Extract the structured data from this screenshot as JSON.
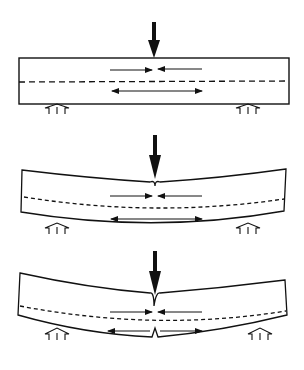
{
  "diagram": {
    "ink_color": "#111111",
    "background": "#ffffff",
    "panels": [
      {
        "id": "stage-1",
        "label": "Straight beam under central load",
        "state": "undeformed",
        "elements": [
          "load-arrow",
          "beam",
          "neutral-axis",
          "compression-arrows",
          "tension-arrows",
          "left-support",
          "right-support"
        ]
      },
      {
        "id": "stage-2",
        "label": "Bent beam with indentation at load point",
        "state": "bending",
        "elements": [
          "load-arrow",
          "beam",
          "neutral-axis",
          "compression-arrows",
          "tension-arrows",
          "left-support",
          "right-support",
          "notch-at-load"
        ]
      },
      {
        "id": "stage-3",
        "label": "Bent beam with crack at bottom tension face",
        "state": "cracking",
        "elements": [
          "load-arrow",
          "beam",
          "neutral-axis",
          "compression-arrows",
          "tension-arrows",
          "left-support",
          "right-support",
          "notch-at-load",
          "crack-at-bottom"
        ]
      }
    ]
  }
}
